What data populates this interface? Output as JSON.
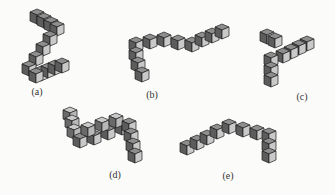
{
  "figure": {
    "panels": [
      {
        "id": "a",
        "label": "(a)",
        "x": 37,
        "y": 93,
        "description": "L/Z-shaped chain of cubes"
      },
      {
        "id": "b",
        "label": "(b)",
        "x": 152,
        "y": 96,
        "description": "chain with vertical leg and horizontal arm"
      },
      {
        "id": "c",
        "label": "(c)",
        "x": 302,
        "y": 98,
        "description": "corner-shaped cube chain"
      },
      {
        "id": "d",
        "label": "(d)",
        "x": 115,
        "y": 176,
        "description": "S-shaped cube chain"
      },
      {
        "id": "e",
        "label": "(e)",
        "x": 228,
        "y": 177,
        "description": "bent cube chain with vertical leg"
      }
    ]
  },
  "colors": {
    "dark": "#5c5c5c",
    "mid": "#8a8a8a",
    "light": "#c9c9c9",
    "edge": "#1e1e1e"
  }
}
